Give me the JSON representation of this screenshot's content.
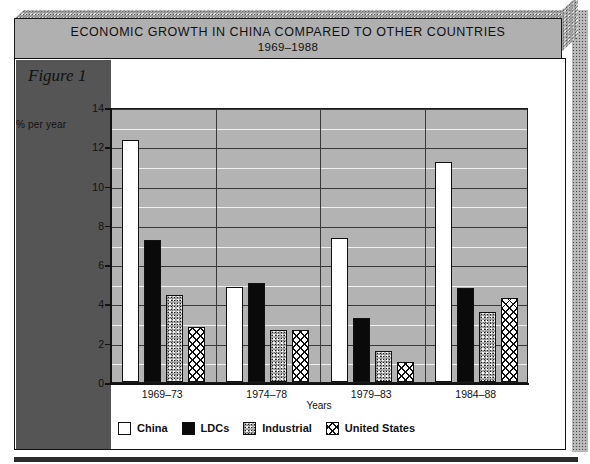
{
  "figure": {
    "label": "Figure 1",
    "title_line1": "ECONOMIC GROWTH IN CHINA COMPARED TO OTHER COUNTRIES",
    "title_line2": "1969–1988"
  },
  "chart_data": {
    "type": "bar",
    "title": "ECONOMIC GROWTH IN CHINA COMPARED TO OTHER COUNTRIES 1969–1988",
    "xlabel": "Years",
    "ylabel": "% per year",
    "categories": [
      "1969–73",
      "1974–78",
      "1979–83",
      "1984–88"
    ],
    "ylim": [
      0,
      14
    ],
    "yticks": [
      0,
      2,
      4,
      6,
      8,
      10,
      12,
      14
    ],
    "ytick_labels": [
      "0",
      "2",
      "4",
      "6",
      "8",
      "10",
      "12",
      "14"
    ],
    "grid": true,
    "legend_position": "bottom-left",
    "series": [
      {
        "name": "China",
        "pattern": "white",
        "values": [
          12.3,
          4.85,
          7.35,
          11.2
        ]
      },
      {
        "name": "LDCs",
        "pattern": "solid-black",
        "values": [
          7.25,
          5.05,
          3.25,
          4.8
        ]
      },
      {
        "name": "Industrial",
        "pattern": "stipple",
        "values": [
          4.45,
          2.65,
          1.6,
          3.55
        ]
      },
      {
        "name": "United States",
        "pattern": "crosshatch",
        "values": [
          2.8,
          2.65,
          1.0,
          4.3
        ]
      }
    ]
  },
  "colors": {
    "banner_face": "#b0b0b0",
    "plot_background": "#b3b3b3",
    "left_panel": "#555555",
    "axis": "#111111",
    "gridline_major": "#3a3a3a",
    "gridline_minor": "#f0f0f0"
  }
}
